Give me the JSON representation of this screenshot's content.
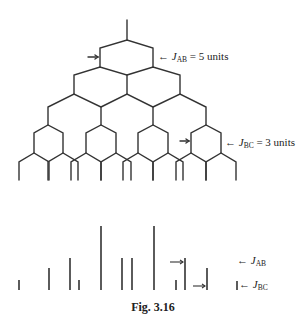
{
  "figure": {
    "caption": "Fig. 3.16",
    "tree_labels": {
      "jab": {
        "symbol": "J",
        "subscript": "AB",
        "suffix": " = 5 units"
      },
      "jbc": {
        "symbol": "J",
        "subscript": "BC",
        "suffix": " = 3 units"
      }
    },
    "spectrum_labels": {
      "jab": {
        "symbol": "J",
        "subscript": "AB"
      },
      "jbc": {
        "symbol": "J",
        "subscript": "BC"
      }
    },
    "arrow": "←",
    "coupling_constants": {
      "J_AB": 5,
      "J_BC": 3
    }
  },
  "stick_spectrum": {
    "positions_px": [
      19,
      49,
      70,
      79,
      101,
      122,
      132,
      154,
      176,
      185,
      207
    ],
    "relative_heights": [
      1,
      2,
      3,
      1,
      6,
      3,
      3,
      6,
      1,
      3,
      2
    ]
  }
}
